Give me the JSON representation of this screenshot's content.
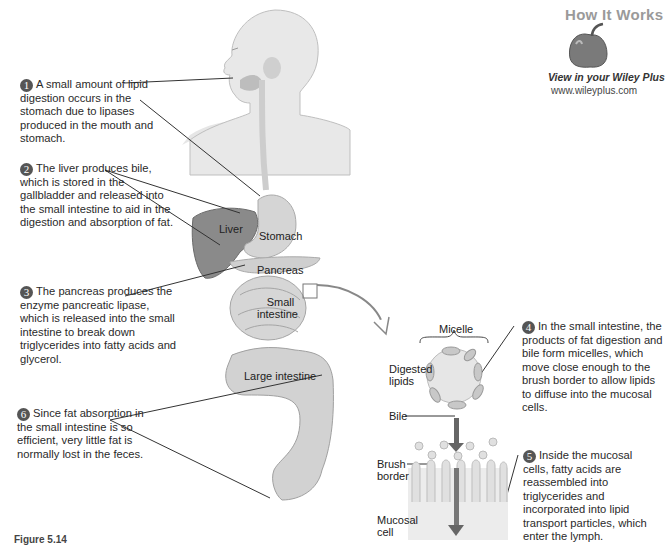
{
  "badge": {
    "title": "How It Works",
    "subtitle": "View in your Wiley Plus",
    "url": "www.wileyplus.com",
    "icon": "pepper-icon"
  },
  "steps": [
    {
      "number": "1",
      "text": "A small amount of lipid digestion occurs in the stomach due to lipases produced in the mouth and stomach."
    },
    {
      "number": "2",
      "text": "The liver produces bile, which is stored in the gallbladder and released into the small intestine to aid in the digestion and absorption of fat."
    },
    {
      "number": "3",
      "text": "The pancreas produces the enzyme pancreatic lipase, which is released into the small intestine to break down triglycerides into fatty acids and glycerol."
    },
    {
      "number": "4",
      "text": "In the small intestine, the products of fat digestion and bile form micelles, which move close enough to the brush border to allow lipids to diffuse into the mucosal cells."
    },
    {
      "number": "5",
      "text": "Inside the mucosal cells, fatty acids are reassembled into triglycerides and incorporated into lipid transport particles, which enter the lymph."
    },
    {
      "number": "6",
      "text": "Since fat absorption in the small intestine is so efficient, very little fat is normally lost in the feces."
    }
  ],
  "organ_labels": {
    "liver": "Liver",
    "stomach": "Stomach",
    "pancreas": "Pancreas",
    "small_intestine_1": "Small",
    "small_intestine_2": "intestine",
    "large_intestine": "Large intestine"
  },
  "detail_labels": {
    "micelle": "Micelle",
    "digested_lipids_1": "Digested",
    "digested_lipids_2": "lipids",
    "bile": "Bile",
    "brush_border_1": "Brush",
    "brush_border_2": "border",
    "mucosal_cell_1": "Mucosal",
    "mucosal_cell_2": "cell"
  },
  "caption": "Figure 5.14",
  "colors": {
    "number_badge": "#555555",
    "organ_fill": "#d9d9d9",
    "liver_fill": "#8a8a8a",
    "micelle_fill": "#e4e4e4",
    "arrow": "#6a6a6a"
  }
}
